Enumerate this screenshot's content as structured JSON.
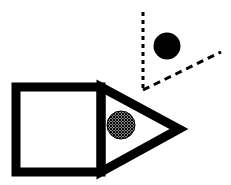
{
  "figure": {
    "width": 231,
    "height": 185,
    "background_color": "#FFFFFF",
    "ink_color": "#000000",
    "elements": [
      {
        "name": "arrow-body-square",
        "label": "Square outline (body of arrow/pencil)",
        "kind": "rectangle-outline",
        "stroke_color": "#000000",
        "stroke_width": 9,
        "fill": "none",
        "x": 16,
        "y": 87,
        "width": 85,
        "height": 85
      },
      {
        "name": "arrow-head-triangle",
        "label": "Triangle outline (head of arrow/pencil) pointing right",
        "kind": "triangle-outline",
        "stroke_color": "#000000",
        "stroke_width": 9,
        "fill": "none",
        "points": "101,87 179,129 101,172"
      },
      {
        "name": "hatched-disc",
        "label": "Cross-hatched circle inside arrow head",
        "kind": "circle",
        "fill": "crosshatch-pattern",
        "stroke_color": "#000000",
        "stroke_width": 1,
        "cx": 121,
        "cy": 125,
        "r": 14
      },
      {
        "name": "solid-disc",
        "label": "Solid black circle above the figure",
        "kind": "circle",
        "fill": "#000000",
        "stroke_color": "none",
        "cx": 167,
        "cy": 46,
        "r": 13.5
      },
      {
        "name": "dashed-angle-vertical-ray",
        "label": "Dashed vertical ray of the angle",
        "kind": "dashed-line",
        "stroke_color": "#000000",
        "stroke_width": 3,
        "dash_pattern": "4 4",
        "x1": 143,
        "y1": 12,
        "x2": 143,
        "y2": 90
      },
      {
        "name": "dashed-angle-diagonal-ray",
        "label": "Dashed diagonal ray of the angle",
        "kind": "dashed-line",
        "stroke_color": "#000000",
        "stroke_width": 3,
        "dash_pattern": "7 5",
        "x1": 143,
        "y1": 90,
        "x2": 221,
        "y2": 52
      },
      {
        "name": "dashed-angle-vertex",
        "label": "Vertex of the dashed angle",
        "kind": "point",
        "x": 143,
        "y": 90
      }
    ]
  }
}
